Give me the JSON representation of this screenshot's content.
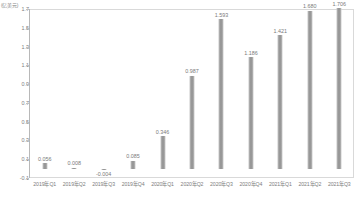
{
  "chart_data": {
    "type": "bar",
    "title": "",
    "xlabel": "",
    "ylabel": "(亿美元)",
    "unit_caption": "(亿美元)",
    "categories": [
      "2019年Q1",
      "2019年Q2",
      "2019年Q3",
      "2019年Q4",
      "2020年Q1",
      "2020年Q2",
      "2020年Q3",
      "2020年Q4",
      "2021年Q1",
      "2021年Q2",
      "2021年Q3"
    ],
    "values": [
      0.056,
      0.008,
      -0.004,
      0.085,
      0.346,
      0.987,
      1.593,
      1.186,
      1.421,
      1.68,
      1.706
    ],
    "value_labels": [
      "0.056",
      "0.008",
      "-0.004",
      "0.085",
      "0.346",
      "0.987",
      "1.593",
      "1.186",
      "1.421",
      "1.680",
      "1.706"
    ],
    "ylim": [
      -0.1,
      1.7
    ],
    "ytick_labels": [
      "1.7",
      "1.5",
      "1.3",
      "1.1",
      "0.9",
      "0.7",
      "0.5",
      "0.3",
      "0.1",
      "-0.1"
    ],
    "ytick_values": [
      1.7,
      1.5,
      1.3,
      1.1,
      0.9,
      0.7,
      0.5,
      0.3,
      0.1,
      -0.1
    ],
    "grid": false,
    "legend": false,
    "legend_position": "none",
    "bar_color": "#8f8f8f",
    "axis_color": "#b8b8b8",
    "label_color": "#7d7d7d",
    "plot_border_color": "#d9d9d9",
    "background_color": "#ffffff"
  }
}
